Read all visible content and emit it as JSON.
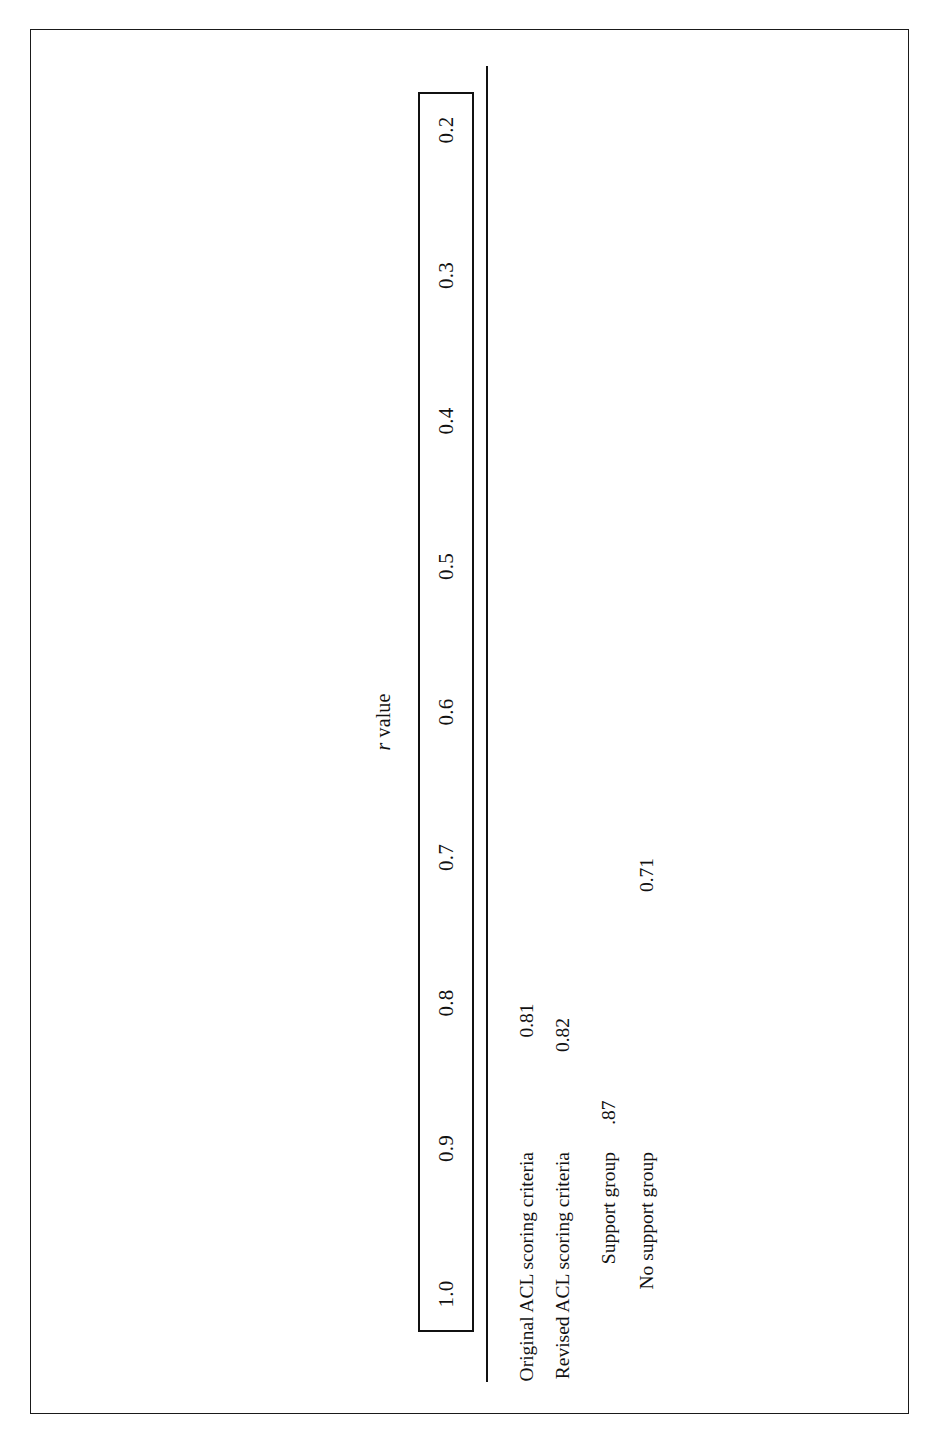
{
  "figure": {
    "orientation": "rotated-90-ccw",
    "border_color": "#1a1a1a",
    "background": "#ffffff"
  },
  "chart_data": {
    "type": "bar",
    "orientation": "horizontal",
    "title": "",
    "xlabel": "r value",
    "ylabel": "",
    "axis_title_prefix": "r",
    "axis_title_suffix": " value",
    "categories": [
      "Original ACL scoring criteria",
      "Revised ACL scoring criteria",
      "Support group",
      "No support group"
    ],
    "values": [
      0.81,
      0.82,
      0.87,
      0.71
    ],
    "value_labels": [
      "0.81",
      "0.82",
      ".87",
      "0.71"
    ],
    "tick_labels": [
      "1.0",
      "0.9",
      "0.8",
      "0.7",
      "0.6",
      "0.5",
      "0.4",
      "0.3",
      "0.2"
    ],
    "tick_values": [
      1.0,
      0.9,
      0.8,
      0.7,
      0.6,
      0.5,
      0.4,
      0.3,
      0.2
    ],
    "xlim": [
      1.0,
      0.2
    ],
    "axis_direction": "descending",
    "grid": false,
    "legend": false,
    "bar_fill": "none"
  }
}
